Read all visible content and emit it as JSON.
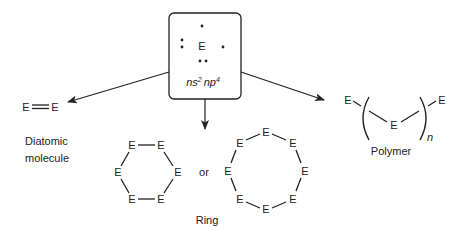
{
  "center_box": {
    "element_symbol": "E",
    "configuration_ns": "ns",
    "configuration_ns_sup": "2",
    "configuration_np": "np",
    "configuration_np_sup": "4"
  },
  "diatomic": {
    "left": "E",
    "right": "E",
    "bond": "double",
    "label_line1": "Diatomic",
    "label_line2": "molecule"
  },
  "ring": {
    "hexagon_atoms": [
      "E",
      "E",
      "E",
      "E",
      "E",
      "E"
    ],
    "connector": "or",
    "octagon_atoms": [
      "E",
      "E",
      "E",
      "E",
      "E",
      "E",
      "E",
      "E"
    ],
    "label": "Ring"
  },
  "polymer": {
    "end_left": "E",
    "repeat_unit": "E",
    "end_right": "E",
    "subscript": "n",
    "label": "Polymer"
  },
  "colors": {
    "ink": "#222222",
    "background": "#ffffff"
  }
}
